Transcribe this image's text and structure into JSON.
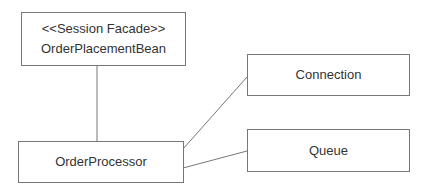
{
  "diagram": {
    "type": "uml-class-dependency",
    "nodes": [
      {
        "id": "facade",
        "stereotype": "<<Session Facade>>",
        "name": "OrderPlacementBean"
      },
      {
        "id": "processor",
        "name": "OrderProcessor"
      },
      {
        "id": "connection",
        "name": "Connection"
      },
      {
        "id": "queue",
        "name": "Queue"
      }
    ],
    "edges": [
      {
        "from": "facade",
        "to": "processor"
      },
      {
        "from": "processor",
        "to": "connection"
      },
      {
        "from": "processor",
        "to": "queue"
      }
    ],
    "colors": {
      "line": "#777777",
      "text": "#333333",
      "background": "#ffffff"
    }
  }
}
